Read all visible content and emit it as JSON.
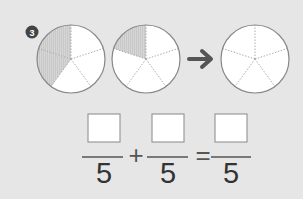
{
  "problem": {
    "number": "3",
    "badge_color": "#444444"
  },
  "circles": [
    {
      "id": "circle-1",
      "parts": 5,
      "shaded": 2
    },
    {
      "id": "circle-2",
      "parts": 5,
      "shaded": 1
    },
    {
      "id": "circle-3",
      "parts": 5,
      "shaded": 0
    }
  ],
  "arrow": {
    "icon": "arrow-right-icon"
  },
  "equation": {
    "term1": {
      "numerator": "",
      "denominator": "5"
    },
    "operator1": "+",
    "term2": {
      "numerator": "",
      "denominator": "5"
    },
    "operator2": "=",
    "result": {
      "numerator": "",
      "denominator": "5"
    }
  },
  "colors": {
    "background": "#e6e6e6",
    "shaded": "#d4d4d4",
    "outline": "#888888",
    "arrow": "#555555"
  }
}
